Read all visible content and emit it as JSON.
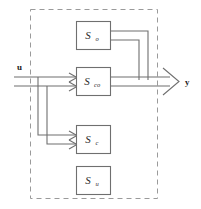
{
  "figure": {
    "type": "block-diagram",
    "name": "Kalman decomposition block diagram",
    "background_color": "#ffffff",
    "line_color": "#6f6f6f",
    "box_border_color": "#6f6f6f",
    "boundary_color": "#9a9a9a",
    "text_color": "#2b2b2b"
  },
  "boundary": {
    "label": "system-boundary",
    "style": "dashed"
  },
  "io": {
    "input_label": "u",
    "output_label": "y"
  },
  "blocks": [
    {
      "id": "s-o",
      "base": "S",
      "subscript": "o",
      "full": "S_o",
      "meaning": "observable-not-controllable"
    },
    {
      "id": "s-co",
      "base": "S",
      "subscript": "co",
      "full": "S_co",
      "meaning": "controllable-and-observable"
    },
    {
      "id": "s-c",
      "base": "S",
      "subscript": "c",
      "full": "S_c",
      "meaning": "controllable-not-observable"
    },
    {
      "id": "s-u",
      "base": "S",
      "subscript": "u",
      "full": "S_u",
      "meaning": "uncontrollable-unobservable"
    }
  ],
  "connections": [
    {
      "id": "input-to-sco",
      "from": "u",
      "to": "S_co",
      "arrow": true
    },
    {
      "id": "input-branch-to-sc",
      "from": "u",
      "to": "S_c",
      "arrow": true
    },
    {
      "id": "so-to-output",
      "from": "S_o",
      "to": "y",
      "arrow": false
    },
    {
      "id": "sco-to-output",
      "from": "S_co",
      "to": "y",
      "arrow": true
    }
  ]
}
